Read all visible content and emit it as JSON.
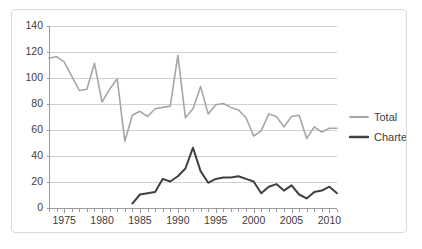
{
  "chart_data": {
    "type": "line",
    "title": "",
    "xlabel": "",
    "ylabel": "",
    "xlim": [
      1973,
      2011
    ],
    "ylim": [
      0,
      140
    ],
    "ytick_labels": [
      "0",
      "20",
      "40",
      "60",
      "80",
      "100",
      "120",
      "140"
    ],
    "ytick_values": [
      0,
      20,
      40,
      60,
      80,
      100,
      120,
      140
    ],
    "xtick_labels": [
      "1975",
      "1980",
      "1985",
      "1990",
      "1995",
      "2000",
      "2005",
      "2010"
    ],
    "xtick_values": [
      1975,
      1980,
      1985,
      1990,
      1995,
      2000,
      2005,
      2010
    ],
    "grid": "horizontal",
    "legend_position": "right",
    "x": [
      1973,
      1974,
      1975,
      1976,
      1977,
      1978,
      1979,
      1980,
      1981,
      1982,
      1983,
      1984,
      1985,
      1986,
      1987,
      1988,
      1989,
      1990,
      1991,
      1992,
      1993,
      1994,
      1995,
      1996,
      1997,
      1998,
      1999,
      2000,
      2001,
      2002,
      2003,
      2004,
      2005,
      2006,
      2007,
      2008,
      2009,
      2010,
      2011
    ],
    "series": [
      {
        "name": "Total",
        "color": "#a6a6a6",
        "values": [
          115,
          116,
          112,
          101,
          90,
          91,
          111,
          81,
          91,
          99,
          51,
          71,
          74,
          70,
          76,
          77,
          78,
          117,
          69,
          76,
          93,
          72,
          79,
          80,
          77,
          75,
          69,
          55,
          59,
          72,
          70,
          62,
          70,
          71,
          53,
          62,
          58,
          61,
          61
        ]
      },
      {
        "name": "Charter",
        "color": "#404040",
        "values": [
          null,
          null,
          null,
          null,
          null,
          null,
          null,
          null,
          null,
          null,
          null,
          3,
          10,
          11,
          12,
          22,
          20,
          24,
          30,
          46,
          28,
          19,
          22,
          23,
          23,
          24,
          22,
          20,
          11,
          16,
          18,
          13,
          17,
          10,
          7,
          12,
          13,
          16,
          11
        ]
      }
    ]
  },
  "legend": {
    "items": [
      {
        "label": "Total",
        "color": "#a6a6a6"
      },
      {
        "label": "Charter",
        "color": "#404040"
      }
    ]
  }
}
